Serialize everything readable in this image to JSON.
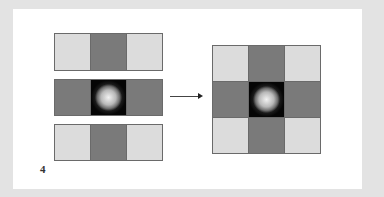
{
  "figure": {
    "label": "4",
    "left_grid": {
      "rows": [
        [
          "light",
          "dark",
          "light"
        ],
        [
          "dark",
          "center",
          "dark"
        ],
        [
          "light",
          "dark",
          "light"
        ]
      ]
    },
    "right_grid": {
      "rows": [
        [
          "light",
          "dark",
          "light"
        ],
        [
          "dark",
          "center",
          "dark"
        ],
        [
          "light",
          "dark",
          "light"
        ]
      ]
    },
    "arrow": "right-arrow",
    "colors": {
      "light": "#dcdcdc",
      "dark": "#7a7a7a",
      "border": "#6a6a6a",
      "background": "#e3e3e3",
      "panel": "#ffffff"
    }
  }
}
